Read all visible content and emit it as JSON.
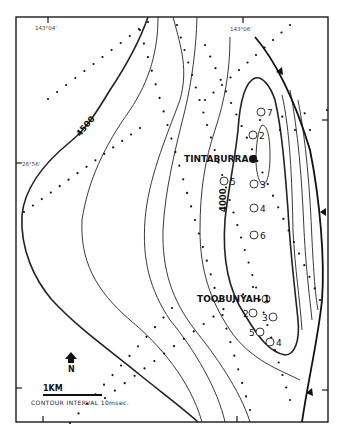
{
  "map": {
    "coordinates": {
      "lon_left": "143°04'",
      "lon_right": "143°06'",
      "lat": "26°56'"
    },
    "contour_labels": [
      "4500",
      "4000"
    ],
    "wells": {
      "tintaburra": {
        "name": "TINTABURRA 1",
        "type": "solid",
        "satellites": [
          "7",
          "2",
          "5",
          "3",
          "4",
          "6"
        ]
      },
      "toobunyah": {
        "name": "TOOBUNYAH 1",
        "type": "open",
        "satellites": [
          "2",
          "3",
          "5",
          "4"
        ]
      }
    },
    "legend": {
      "north_label": "N",
      "scale_label": "1KM",
      "contour_interval": "CONTOUR INTERVAL 10msec."
    },
    "colors": {
      "ink": "#111111",
      "paper": "#ffffff"
    }
  }
}
